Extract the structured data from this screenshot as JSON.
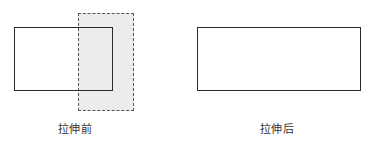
{
  "diagram": {
    "before": {
      "label": "拉伸前",
      "selection_box": {
        "x": 78,
        "y": 13,
        "w": 56,
        "h": 98,
        "style": "dashed",
        "fill": "#ececec",
        "stroke": "#555555"
      },
      "rectangle": {
        "x": 14,
        "y": 27,
        "w": 99,
        "h": 64,
        "style": "solid",
        "stroke": "#2a2a2a"
      }
    },
    "after": {
      "label": "拉伸后",
      "rectangle": {
        "x": 197,
        "y": 27,
        "w": 164,
        "h": 64,
        "style": "solid",
        "stroke": "#2a2a2a"
      }
    }
  }
}
